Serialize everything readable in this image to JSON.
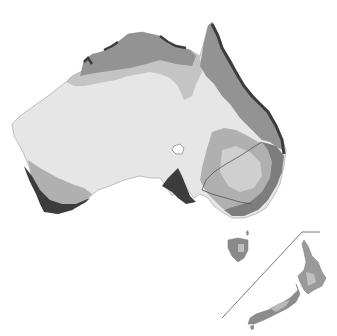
{
  "map": {
    "title": "",
    "regions": [
      "Australia",
      "Tasmania",
      "New Zealand North Island",
      "New Zealand South Island"
    ],
    "zone_colors": {
      "arid": "#e6e6e6",
      "semi_arid": "#c4c4c4",
      "grassland": "#b0b0b0",
      "subtropical": "#939393",
      "temperate": "#7d7d7d",
      "wet_coastal": "#3c3c3c",
      "lake": "#ffffff",
      "boundary_line": "#555555"
    },
    "inset_divider": "New Zealand inset line"
  }
}
